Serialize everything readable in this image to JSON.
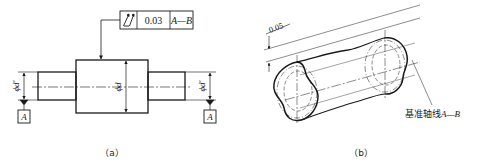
{
  "figure_a": {
    "caption": "（a）",
    "tolerance_frame": {
      "symbol": "circular-runout-icon",
      "value": "0.03",
      "datum": "A—B"
    },
    "dimensions": {
      "left_diameter": "ϕd'",
      "middle_diameter": "ϕd",
      "right_diameter": "ϕd'"
    },
    "datum_labels": {
      "left": "A",
      "right": "A"
    }
  },
  "figure_b": {
    "caption": "（b）",
    "tolerance_zone_width": "0.05",
    "axis_label_prefix": "基准轴线",
    "axis_label_datum": "A—B"
  },
  "colors": {
    "line": "#1a1a1a",
    "background": "#ffffff"
  }
}
